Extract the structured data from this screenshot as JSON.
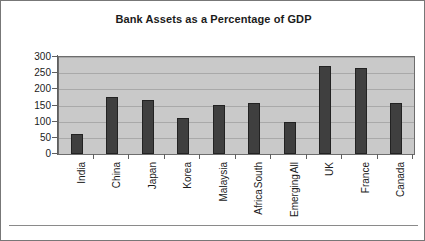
{
  "chart_data": {
    "type": "bar",
    "title": "Bank Assets as a Percentage of GDP",
    "xlabel": "",
    "ylabel": "",
    "ylim": [
      0,
      300
    ],
    "yticks": [
      0,
      50,
      100,
      150,
      200,
      250,
      300
    ],
    "ytick_labels": [
      "0",
      "50",
      "100",
      "150",
      "200",
      "250",
      "300"
    ],
    "grid": true,
    "legend": false,
    "categories": [
      "India",
      "China",
      "Japan",
      "Korea",
      "Malaysia",
      "South Africa",
      "All Emerging",
      "UK",
      "France",
      "Canada"
    ],
    "category_lines": [
      [
        "India"
      ],
      [
        "China"
      ],
      [
        "Japan"
      ],
      [
        "Korea"
      ],
      [
        "Malaysia"
      ],
      [
        "South",
        "Africa"
      ],
      [
        "All",
        "Emerging"
      ],
      [
        "UK"
      ],
      [
        "France"
      ],
      [
        "Canada"
      ]
    ],
    "values": [
      62,
      175,
      168,
      110,
      152,
      157,
      98,
      272,
      265,
      157
    ],
    "bar_color": "#3f3f3f",
    "plot_background": "#c9c9c9",
    "gridline_color": "#a9a9a9"
  },
  "frame": {
    "border_color": "#777777"
  }
}
